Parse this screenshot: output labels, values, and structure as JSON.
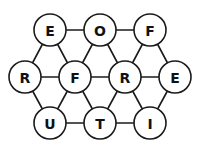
{
  "diagram": {
    "type": "letter-grid-puzzle",
    "nodes": [
      {
        "id": "n1",
        "letter": "E",
        "x": 50,
        "y": 30
      },
      {
        "id": "n2",
        "letter": "O",
        "x": 100,
        "y": 30
      },
      {
        "id": "n3",
        "letter": "F",
        "x": 150,
        "y": 30
      },
      {
        "id": "n4",
        "letter": "R",
        "x": 25,
        "y": 77
      },
      {
        "id": "n5",
        "letter": "F",
        "x": 75,
        "y": 77
      },
      {
        "id": "n6",
        "letter": "R",
        "x": 125,
        "y": 77
      },
      {
        "id": "n7",
        "letter": "E",
        "x": 175,
        "y": 77
      },
      {
        "id": "n8",
        "letter": "U",
        "x": 50,
        "y": 123
      },
      {
        "id": "n9",
        "letter": "T",
        "x": 100,
        "y": 123
      },
      {
        "id": "n10",
        "letter": "I",
        "x": 150,
        "y": 123
      }
    ],
    "edges": [
      [
        "n1",
        "n2"
      ],
      [
        "n2",
        "n3"
      ],
      [
        "n4",
        "n5"
      ],
      [
        "n5",
        "n6"
      ],
      [
        "n6",
        "n7"
      ],
      [
        "n8",
        "n9"
      ],
      [
        "n9",
        "n10"
      ],
      [
        "n1",
        "n4"
      ],
      [
        "n1",
        "n5"
      ],
      [
        "n2",
        "n5"
      ],
      [
        "n2",
        "n6"
      ],
      [
        "n3",
        "n6"
      ],
      [
        "n3",
        "n7"
      ],
      [
        "n4",
        "n8"
      ],
      [
        "n5",
        "n8"
      ],
      [
        "n5",
        "n9"
      ],
      [
        "n6",
        "n9"
      ],
      [
        "n6",
        "n10"
      ],
      [
        "n7",
        "n10"
      ]
    ],
    "node_radius": 16,
    "colors": {
      "stroke": "#1a1a1a",
      "fill": "#ffffff",
      "text": "#111111"
    }
  }
}
